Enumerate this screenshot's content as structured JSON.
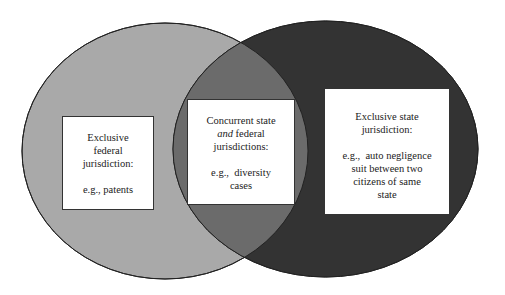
{
  "diagram": {
    "type": "venn",
    "colors": {
      "background": "#ffffff",
      "federal_circle": "#a9a9a9",
      "state_circle": "#333333",
      "overlap": "#6b6b6b",
      "outline": "#222222",
      "box_fill": "#ffffff"
    },
    "sets": [
      {
        "id": "federal",
        "shape": {
          "cx": 165,
          "cy": 151,
          "rx": 143,
          "ry": 128
        }
      },
      {
        "id": "state",
        "shape": {
          "cx": 325.5,
          "cy": 149,
          "rx": 152.5,
          "ry": 128
        }
      }
    ],
    "regions": {
      "federal_only": {
        "title_lines": [
          "Exclusive",
          "federal",
          "jurisdiction:"
        ],
        "example_lines": [
          "e.g.,  patents"
        ]
      },
      "concurrent": {
        "title_line1": "Concurrent  state",
        "title_line2_italic": "and",
        "title_line2_rest": " federal",
        "title_line3": "jurisdictions:",
        "example_lines": [
          "e.g.,  diversity",
          "cases"
        ]
      },
      "state_only": {
        "title_lines": [
          "Exclusive state",
          "jurisdiction:"
        ],
        "example_lines": [
          "e.g.,  auto negligence",
          "suit between two",
          "citizens of same",
          "state"
        ]
      }
    }
  }
}
